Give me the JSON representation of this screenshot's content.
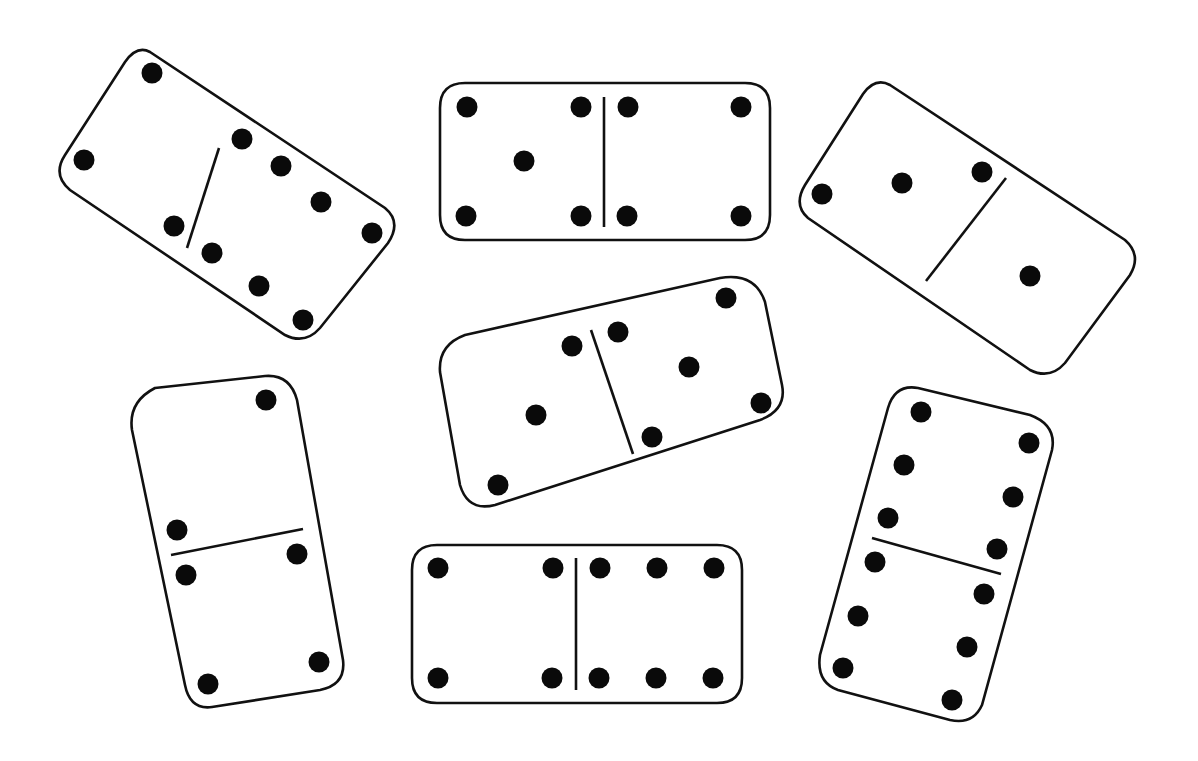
{
  "title": "Seven dominoes",
  "colors": {
    "background": "#ffffff",
    "outline": "#111111",
    "pip": "#0a0a0a"
  },
  "dominoes": [
    {
      "id": "domino-1",
      "position": "top-left",
      "values": [
        4,
        6
      ],
      "label": "4-6",
      "outline": "M150,52 L385,208 Q402,222 388,243 L320,328 Q305,345 285,335 L70,190 Q52,175 65,155 L125,62 Q137,45 150,52 Z",
      "divider": [
        219,
        148,
        187,
        248
      ],
      "pips": [
        [
          152,
          73
        ],
        [
          84,
          160
        ],
        [
          242,
          139
        ],
        [
          174,
          226
        ],
        [
          281,
          166
        ],
        [
          321,
          202
        ],
        [
          372,
          233
        ],
        [
          212,
          253
        ],
        [
          259,
          286
        ],
        [
          303,
          320
        ]
      ]
    },
    {
      "id": "domino-2",
      "position": "top-center",
      "values": [
        5,
        4
      ],
      "label": "5-4",
      "outline": "M465,83 L745,83 Q770,83 770,108 L770,215 Q770,240 745,240 L465,240 Q440,240 440,215 L440,108 Q440,83 465,83 Z",
      "divider": [
        604,
        97,
        604,
        227
      ],
      "pips": [
        [
          467,
          107
        ],
        [
          581,
          107
        ],
        [
          524,
          161
        ],
        [
          466,
          216
        ],
        [
          581,
          216
        ],
        [
          628,
          107
        ],
        [
          741,
          107
        ],
        [
          627,
          216
        ],
        [
          741,
          216
        ]
      ]
    },
    {
      "id": "domino-3",
      "position": "top-right",
      "values": [
        3,
        1
      ],
      "label": "3-1",
      "outline": "M890,85 L1125,240 Q1142,255 1130,275 L1065,363 Q1050,380 1030,370 L808,218 Q793,205 805,185 L863,94 Q875,77 890,85 Z",
      "divider": [
        1006,
        178,
        926,
        281
      ],
      "pips": [
        [
          822,
          194
        ],
        [
          902,
          183
        ],
        [
          982,
          172
        ],
        [
          1030,
          276
        ]
      ]
    },
    {
      "id": "domino-4",
      "position": "center",
      "values": [
        3,
        5
      ],
      "label": "3-5",
      "outline": "M465,335 L720,278 Q755,272 765,302 L782,385 Q787,410 760,420 L495,505 Q468,512 460,485 L440,372 Q438,345 465,335 Z",
      "divider": [
        591,
        330,
        633,
        454
      ],
      "pips": [
        [
          572,
          346
        ],
        [
          536,
          415
        ],
        [
          498,
          485
        ],
        [
          618,
          332
        ],
        [
          689,
          367
        ],
        [
          726,
          298
        ],
        [
          761,
          403
        ],
        [
          652,
          437
        ]
      ]
    },
    {
      "id": "domino-5",
      "position": "bottom-left",
      "values": [
        2,
        3
      ],
      "label": "2-3",
      "outline": "M155,388 L265,376 Q290,374 297,400 L343,660 Q346,685 320,690 L212,707 Q190,710 185,685 L132,430 Q128,402 155,388 Z",
      "divider": [
        171,
        555,
        303,
        529
      ],
      "pips": [
        [
          266,
          400
        ],
        [
          177,
          530
        ],
        [
          186,
          575
        ],
        [
          297,
          554
        ],
        [
          319,
          662
        ],
        [
          208,
          684
        ]
      ]
    },
    {
      "id": "domino-6",
      "position": "bottom-center",
      "values": [
        4,
        6
      ],
      "label": "4-6",
      "outline": "M437,545 L717,545 Q742,545 742,570 L742,678 Q742,703 717,703 L437,703 Q412,703 412,678 L412,570 Q412,545 437,545 Z",
      "divider": [
        576,
        558,
        576,
        690
      ],
      "pips": [
        [
          438,
          568
        ],
        [
          553,
          568
        ],
        [
          438,
          678
        ],
        [
          552,
          678
        ],
        [
          600,
          568
        ],
        [
          657,
          568
        ],
        [
          714,
          568
        ],
        [
          599,
          678
        ],
        [
          656,
          678
        ],
        [
          713,
          678
        ]
      ]
    },
    {
      "id": "domino-7",
      "position": "bottom-right",
      "values": [
        6,
        6
      ],
      "label": "6-6",
      "outline": "M918,388 L1030,415 Q1057,425 1052,450 L982,705 Q973,725 950,720 L838,690 Q816,682 820,655 L888,408 Q895,384 918,388 Z",
      "divider": [
        872,
        538,
        1001,
        574
      ],
      "pips": [
        [
          921,
          412
        ],
        [
          904,
          465
        ],
        [
          888,
          518
        ],
        [
          1029,
          443
        ],
        [
          1013,
          497
        ],
        [
          997,
          549
        ],
        [
          875,
          562
        ],
        [
          858,
          616
        ],
        [
          843,
          668
        ],
        [
          984,
          594
        ],
        [
          967,
          647
        ],
        [
          952,
          700
        ]
      ]
    }
  ]
}
